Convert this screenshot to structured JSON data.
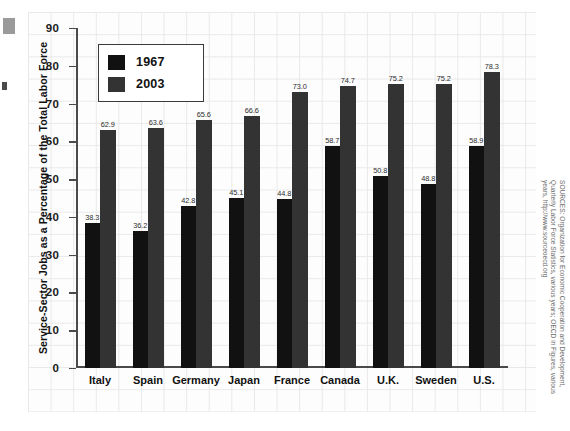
{
  "chart_data": {
    "type": "bar",
    "title": "",
    "xlabel": "",
    "ylabel": "Service-Sector Jobs as a Percentage of the Total Labor Force",
    "ylim": [
      0,
      90
    ],
    "yticks": [
      0,
      10,
      20,
      30,
      40,
      50,
      60,
      70,
      80,
      90
    ],
    "grid": true,
    "legend_position": "top-left",
    "categories": [
      "Italy",
      "Spain",
      "Germany",
      "Japan",
      "France",
      "Canada",
      "U.K.",
      "Sweden",
      "U.S."
    ],
    "series": [
      {
        "name": "1967",
        "color": "#111111",
        "values": [
          38.3,
          36.2,
          42.8,
          45.1,
          44.8,
          58.7,
          50.8,
          48.8,
          58.9
        ],
        "labels": [
          "38.3",
          "36.2",
          "42.8",
          "45.1",
          "44.8",
          "58.7",
          "50.8",
          "48.8",
          "58.9"
        ]
      },
      {
        "name": "2003",
        "color": "#333333",
        "values": [
          62.9,
          63.6,
          65.6,
          66.6,
          73.0,
          74.7,
          75.2,
          75.2,
          78.3
        ],
        "labels": [
          "62.9",
          "63.6",
          "65.6",
          "66.6",
          "73.0",
          "74.7",
          "75.2",
          "75.2",
          "78.3"
        ]
      }
    ],
    "source": "SOURCES: Organization for Economic Cooperation and Development, Quarterly Labor Force Statistics, various years; OECD in Figures, various years, http://www.sourceoecd.org"
  },
  "legend": {
    "items": [
      {
        "label": "1967",
        "swatch": "#111111"
      },
      {
        "label": "2003",
        "swatch": "#333333"
      }
    ]
  },
  "axis": {
    "y_title": "Service-Sector Jobs as a Percentage of the Total Labor Force",
    "tick_labels": [
      "90",
      "80",
      "70",
      "60",
      "50",
      "40",
      "30",
      "20",
      "10",
      "0"
    ]
  },
  "source_note": "SOURCES: Organization for Economic Cooperation and Development, Quarterly Labor Force Statistics, various years; OECD in Figures, various years, http://www.sourceoecd.org"
}
